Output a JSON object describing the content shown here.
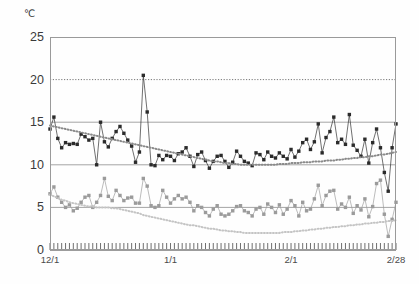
{
  "chart_data": {
    "type": "line",
    "title": "",
    "subtitle": "",
    "xlabel": "",
    "ylabel": "℃",
    "unit": "℃",
    "ylim": [
      0,
      25
    ],
    "yticks": [
      0,
      5,
      10,
      15,
      20,
      25
    ],
    "ytick_labels": [
      "0",
      "5",
      "10",
      "15",
      "20",
      "25"
    ],
    "grid": "horizontal",
    "gridlines": [
      {
        "value": 5,
        "style": "solid"
      },
      {
        "value": 10,
        "style": "solid"
      },
      {
        "value": 15,
        "style": "solid"
      },
      {
        "value": 20,
        "style": "dotted"
      }
    ],
    "legend": "none",
    "x_axis_type": "daily",
    "x_tick_count": 90,
    "xtick_labels": [
      "12/1",
      "1/1",
      "2/1",
      "2/28"
    ],
    "xtick_indices": [
      0,
      31,
      62,
      89
    ],
    "x": [
      "12/1",
      "12/2",
      "12/3",
      "12/4",
      "12/5",
      "12/6",
      "12/7",
      "12/8",
      "12/9",
      "12/10",
      "12/11",
      "12/12",
      "12/13",
      "12/14",
      "12/15",
      "12/16",
      "12/17",
      "12/18",
      "12/19",
      "12/20",
      "12/21",
      "12/22",
      "12/23",
      "12/24",
      "12/25",
      "12/26",
      "12/27",
      "12/28",
      "12/29",
      "12/30",
      "12/31",
      "1/1",
      "1/2",
      "1/3",
      "1/4",
      "1/5",
      "1/6",
      "1/7",
      "1/8",
      "1/9",
      "1/10",
      "1/11",
      "1/12",
      "1/13",
      "1/14",
      "1/15",
      "1/16",
      "1/17",
      "1/18",
      "1/19",
      "1/20",
      "1/21",
      "1/22",
      "1/23",
      "1/24",
      "1/25",
      "1/26",
      "1/27",
      "1/28",
      "1/29",
      "1/30",
      "1/31",
      "2/1",
      "2/2",
      "2/3",
      "2/4",
      "2/5",
      "2/6",
      "2/7",
      "2/8",
      "2/9",
      "2/10",
      "2/11",
      "2/12",
      "2/13",
      "2/14",
      "2/15",
      "2/16",
      "2/17",
      "2/18",
      "2/19",
      "2/20",
      "2/21",
      "2/22",
      "2/23",
      "2/24",
      "2/25",
      "2/26",
      "2/27",
      "2/28"
    ],
    "series": [
      {
        "name": "upper-series",
        "style": "line-markers",
        "color": "#2b2b2b",
        "marker": "square",
        "values": [
          14.2,
          15.6,
          13.1,
          12.0,
          12.6,
          12.4,
          12.5,
          12.4,
          13.6,
          13.3,
          12.9,
          13.1,
          10.0,
          15.0,
          12.7,
          12.1,
          13.1,
          13.9,
          14.5,
          13.7,
          12.9,
          12.2,
          10.3,
          11.5,
          20.5,
          16.2,
          10.0,
          9.9,
          11.1,
          10.6,
          11.1,
          11.0,
          10.5,
          11.3,
          11.5,
          12.0,
          11.0,
          9.8,
          11.2,
          11.5,
          10.5,
          9.6,
          10.4,
          11.0,
          11.1,
          10.4,
          9.7,
          10.3,
          11.6,
          11.0,
          10.4,
          10.2,
          9.9,
          11.4,
          11.2,
          10.6,
          11.5,
          11.0,
          10.8,
          11.4,
          11.0,
          10.7,
          11.8,
          10.9,
          11.6,
          12.6,
          13.0,
          11.8,
          12.7,
          14.8,
          11.4,
          13.2,
          13.9,
          15.6,
          12.6,
          13.0,
          12.4,
          15.9,
          12.3,
          11.7,
          11.0,
          13.0,
          10.2,
          12.6,
          14.2,
          12.0,
          9.1,
          6.9,
          12.0,
          14.8
        ]
      },
      {
        "name": "upper-trend",
        "style": "dotted-smooth",
        "color": "#8a8a8a",
        "marker": "none",
        "values": [
          14.6,
          14.5,
          14.4,
          14.3,
          14.2,
          14.1,
          14.0,
          13.9,
          13.8,
          13.7,
          13.6,
          13.5,
          13.4,
          13.3,
          13.2,
          13.1,
          13.0,
          12.9,
          12.8,
          12.7,
          12.6,
          12.5,
          12.4,
          12.3,
          12.2,
          12.1,
          12.0,
          11.9,
          11.8,
          11.7,
          11.6,
          11.5,
          11.4,
          11.3,
          11.2,
          11.1,
          11.0,
          10.9,
          10.8,
          10.7,
          10.6,
          10.5,
          10.4,
          10.4,
          10.3,
          10.2,
          10.2,
          10.1,
          10.1,
          10.0,
          10.0,
          10.0,
          10.0,
          10.0,
          10.0,
          10.0,
          10.0,
          10.0,
          10.0,
          10.1,
          10.1,
          10.1,
          10.2,
          10.2,
          10.2,
          10.3,
          10.3,
          10.3,
          10.4,
          10.4,
          10.4,
          10.5,
          10.5,
          10.5,
          10.6,
          10.6,
          10.7,
          10.7,
          10.8,
          10.8,
          10.9,
          10.9,
          11.0,
          11.0,
          11.1,
          11.2,
          11.2,
          11.3,
          11.4,
          11.5
        ]
      },
      {
        "name": "lower-series",
        "style": "line-markers",
        "color": "#9b9b9b",
        "marker": "square",
        "values": [
          6.6,
          7.4,
          6.2,
          5.6,
          5.0,
          5.3,
          4.6,
          4.9,
          5.6,
          6.2,
          6.4,
          5.0,
          5.6,
          6.4,
          8.4,
          6.3,
          5.8,
          7.0,
          6.4,
          5.8,
          6.1,
          6.2,
          5.5,
          5.5,
          8.4,
          7.5,
          5.2,
          5.0,
          5.2,
          7.0,
          6.2,
          5.5,
          6.0,
          6.4,
          6.0,
          6.2,
          5.6,
          4.6,
          5.2,
          5.0,
          4.4,
          4.0,
          4.8,
          5.2,
          4.2,
          4.0,
          4.2,
          4.6,
          5.1,
          5.2,
          4.6,
          4.4,
          4.0,
          4.8,
          5.0,
          4.2,
          5.4,
          5.0,
          4.4,
          5.3,
          4.2,
          4.8,
          5.8,
          5.2,
          4.0,
          5.6,
          4.6,
          4.8,
          6.0,
          7.6,
          5.2,
          6.4,
          6.9,
          7.0,
          4.8,
          5.4,
          5.0,
          6.2,
          4.3,
          5.2,
          4.7,
          6.0,
          3.9,
          5.1,
          7.8,
          8.2,
          4.2,
          1.6,
          3.6,
          5.6
        ]
      },
      {
        "name": "lower-trend",
        "style": "dotted-smooth",
        "color": "#c4c4c4",
        "marker": "none",
        "values": [
          6.5,
          6.3,
          6.1,
          5.9,
          5.8,
          5.6,
          5.5,
          5.4,
          5.3,
          5.2,
          5.1,
          5.1,
          5.0,
          5.0,
          5.0,
          5.0,
          4.9,
          4.9,
          4.8,
          4.7,
          4.6,
          4.5,
          4.4,
          4.3,
          4.1,
          4.0,
          3.9,
          3.8,
          3.7,
          3.6,
          3.5,
          3.4,
          3.3,
          3.2,
          3.1,
          3.0,
          2.9,
          2.9,
          2.8,
          2.7,
          2.6,
          2.5,
          2.5,
          2.4,
          2.3,
          2.3,
          2.2,
          2.2,
          2.1,
          2.1,
          2.0,
          2.0,
          2.0,
          2.0,
          2.0,
          2.0,
          2.0,
          2.0,
          2.0,
          2.0,
          2.1,
          2.1,
          2.1,
          2.2,
          2.2,
          2.3,
          2.3,
          2.4,
          2.4,
          2.5,
          2.5,
          2.6,
          2.6,
          2.7,
          2.7,
          2.8,
          2.8,
          2.9,
          2.9,
          3.0,
          3.0,
          3.1,
          3.1,
          3.2,
          3.2,
          3.3,
          3.3,
          3.4,
          3.4,
          3.5
        ]
      }
    ]
  }
}
